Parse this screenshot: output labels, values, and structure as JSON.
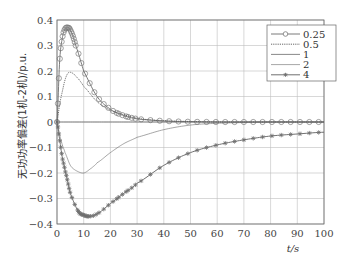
{
  "chart_data": {
    "type": "line",
    "title": "",
    "xlabel": "t/s",
    "ylabel": "无功功率偏差(1机-2机)/p.u.",
    "xlim": [
      0,
      100
    ],
    "ylim": [
      -0.4,
      0.4
    ],
    "xticks": [
      0,
      10,
      20,
      30,
      40,
      50,
      60,
      70,
      80,
      90,
      100
    ],
    "yticks": [
      0.4,
      0.3,
      0.2,
      0.1,
      0,
      -0.1,
      -0.2,
      -0.3,
      -0.4
    ],
    "ytick_labels": [
      "0.4",
      "0.3",
      "0.2",
      "0.1",
      "0",
      "−0.1",
      "−0.2",
      "−0.3",
      "−0.4"
    ],
    "grid": true,
    "legend_position": "upper right",
    "series": [
      {
        "name": "0.25",
        "marker": "diamond",
        "style": "solid",
        "x": [
          0,
          1,
          2,
          3,
          4,
          5,
          7,
          10,
          15,
          20,
          25,
          30,
          40,
          50,
          60,
          70,
          80,
          90,
          100
        ],
        "values": [
          0,
          0.24,
          0.33,
          0.365,
          0.37,
          0.36,
          0.3,
          0.2,
          0.1,
          0.05,
          0.025,
          0.012,
          0.004,
          0.001,
          0,
          0,
          0,
          0,
          0
        ]
      },
      {
        "name": "0.5",
        "marker": "none",
        "style": "dotted",
        "x": [
          0,
          1,
          2,
          3,
          4,
          5,
          7,
          10,
          15,
          20,
          30,
          40,
          50,
          60,
          70,
          80,
          90,
          100
        ],
        "values": [
          0,
          0.07,
          0.12,
          0.165,
          0.19,
          0.195,
          0.18,
          0.14,
          0.08,
          0.045,
          0.015,
          0.005,
          0.002,
          0,
          0,
          0,
          0,
          0
        ]
      },
      {
        "name": "1",
        "marker": "none",
        "style": "solid",
        "x": [
          0,
          10,
          20,
          30,
          40,
          50,
          60,
          70,
          80,
          90,
          100
        ],
        "values": [
          0,
          0,
          0,
          0,
          0,
          0,
          0,
          0,
          0,
          0,
          0
        ]
      },
      {
        "name": "2",
        "marker": "none",
        "style": "thin",
        "x": [
          0,
          1,
          2,
          3,
          5,
          7,
          10,
          13,
          15,
          20,
          25,
          30,
          40,
          50,
          60,
          70,
          80,
          90,
          100
        ],
        "values": [
          0,
          -0.05,
          -0.09,
          -0.12,
          -0.17,
          -0.19,
          -0.2,
          -0.18,
          -0.16,
          -0.12,
          -0.085,
          -0.06,
          -0.03,
          -0.012,
          -0.005,
          -0.002,
          0,
          0,
          0
        ]
      },
      {
        "name": "4",
        "marker": "asterisk",
        "style": "solid",
        "x": [
          0,
          1,
          2,
          3,
          5,
          8,
          10,
          12,
          15,
          20,
          25,
          30,
          40,
          50,
          60,
          70,
          80,
          90,
          100
        ],
        "values": [
          0,
          -0.07,
          -0.14,
          -0.19,
          -0.28,
          -0.35,
          -0.365,
          -0.37,
          -0.36,
          -0.32,
          -0.28,
          -0.24,
          -0.17,
          -0.12,
          -0.09,
          -0.07,
          -0.055,
          -0.047,
          -0.04
        ]
      }
    ]
  },
  "colors": {
    "axis": "#555555",
    "grid": "#bdbdbd",
    "series_0.25": "#7a7a7a",
    "series_0.5": "#555555",
    "series_1": "#6a6a6a",
    "series_2": "#6a6a6a",
    "series_4": "#707070"
  }
}
